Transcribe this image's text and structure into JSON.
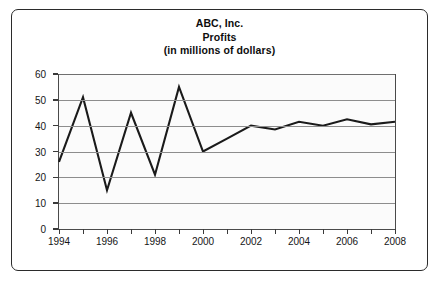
{
  "chart_data": {
    "type": "line",
    "title": "ABC, Inc.",
    "subtitle": "Profits",
    "units_note": "(in millions of dollars)",
    "xlabel": "",
    "ylabel": "",
    "x": [
      1994,
      1995,
      1996,
      1997,
      1998,
      1999,
      2000,
      2001,
      2002,
      2003,
      2004,
      2005,
      2006,
      2007,
      2008
    ],
    "values": [
      26,
      51,
      15,
      45,
      21,
      55,
      30,
      35,
      40,
      38.5,
      41.5,
      40,
      42.5,
      40.5,
      41.5
    ],
    "series": [
      {
        "name": "Profits",
        "values": [
          26,
          51,
          15,
          45,
          21,
          55,
          30,
          35,
          40,
          38.5,
          41.5,
          40,
          42.5,
          40.5,
          41.5
        ]
      }
    ],
    "xlim": [
      1994,
      2008
    ],
    "ylim": [
      0,
      60
    ],
    "yticks": [
      0,
      10,
      20,
      30,
      40,
      50,
      60
    ],
    "ytick_labels": [
      "0",
      "10",
      "20",
      "30",
      "40",
      "50",
      "60"
    ],
    "xticks": [
      1994,
      1995,
      1996,
      1997,
      1998,
      1999,
      2000,
      2001,
      2002,
      2003,
      2004,
      2005,
      2006,
      2007,
      2008
    ],
    "xtick_labels": [
      "1994",
      "",
      "1996",
      "",
      "1998",
      "",
      "2000",
      "",
      "2002",
      "",
      "2004",
      "",
      "2006",
      "",
      "2008"
    ],
    "grid": true,
    "grid_axis": "y",
    "legend": false,
    "legend_position": "none",
    "line_color": "#1a1a1a",
    "grid_color": "#8d8d8d",
    "axis_color": "#3a3a3a",
    "plot_background": "#fbfbfb",
    "frame_color": "#2b2b2b"
  }
}
